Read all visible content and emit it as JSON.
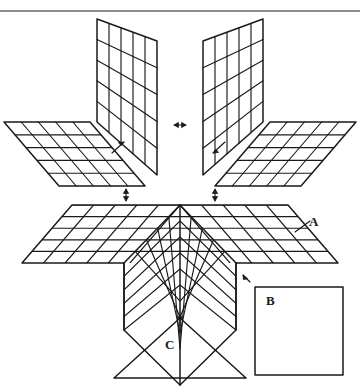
{
  "figure": {
    "kind": "technical-line-diagram",
    "stroke_color": "#1a1a1a",
    "background_color": "#ffffff",
    "labels": [
      {
        "id": "A",
        "text": "A",
        "target": "large-folded-corner-grid"
      },
      {
        "id": "B",
        "text": "B",
        "target": "blank-square-panel"
      },
      {
        "id": "C",
        "text": "C",
        "target": "blank-triangle-panel"
      }
    ],
    "arrows": [
      {
        "id": "arrow-center-horizontal",
        "text": "↔",
        "kind": "double-head-horizontal"
      },
      {
        "id": "arrow-upper-left-rotate",
        "text": "↗",
        "kind": "diagonal-up-right"
      },
      {
        "id": "arrow-upper-right-rotate",
        "text": "↙",
        "kind": "diagonal-down-left"
      },
      {
        "id": "arrow-mid-left-vertical",
        "text": "↕",
        "kind": "double-head-vertical"
      },
      {
        "id": "arrow-mid-right-vertical",
        "text": "↕",
        "kind": "double-head-vertical"
      },
      {
        "id": "arrow-bottom-up",
        "text": "↑",
        "kind": "single-head-up"
      },
      {
        "id": "arrow-square-pointer",
        "text": "↖",
        "kind": "diagonal-up-left"
      }
    ],
    "panels": [
      {
        "id": "vertical-panel-left",
        "rows": 5,
        "cols": 5,
        "orientation": "vertical-left"
      },
      {
        "id": "vertical-panel-right",
        "rows": 5,
        "cols": 5,
        "orientation": "vertical-right"
      },
      {
        "id": "horizontal-panel-left",
        "rows": 5,
        "cols": 5,
        "orientation": "horizontal-left"
      },
      {
        "id": "horizontal-panel-right",
        "rows": 5,
        "cols": 5,
        "orientation": "horizontal-right"
      },
      {
        "id": "corner-face-top-left",
        "rows": 5,
        "cols": 5,
        "orientation": "corner-top-left"
      },
      {
        "id": "corner-face-top-right",
        "rows": 5,
        "cols": 5,
        "orientation": "corner-top-right"
      },
      {
        "id": "corner-face-front-left",
        "rows": 5,
        "cols": 5,
        "orientation": "corner-front-left"
      },
      {
        "id": "corner-face-front-right",
        "rows": 5,
        "cols": 5,
        "orientation": "corner-front-right"
      },
      {
        "id": "blank-square-panel",
        "rows": 1,
        "cols": 1,
        "orientation": "flat-square"
      },
      {
        "id": "blank-triangle-panel",
        "rows": 1,
        "cols": 1,
        "orientation": "flat-triangle"
      }
    ],
    "top_rule": {
      "id": "page-top-rule",
      "present": true
    }
  }
}
